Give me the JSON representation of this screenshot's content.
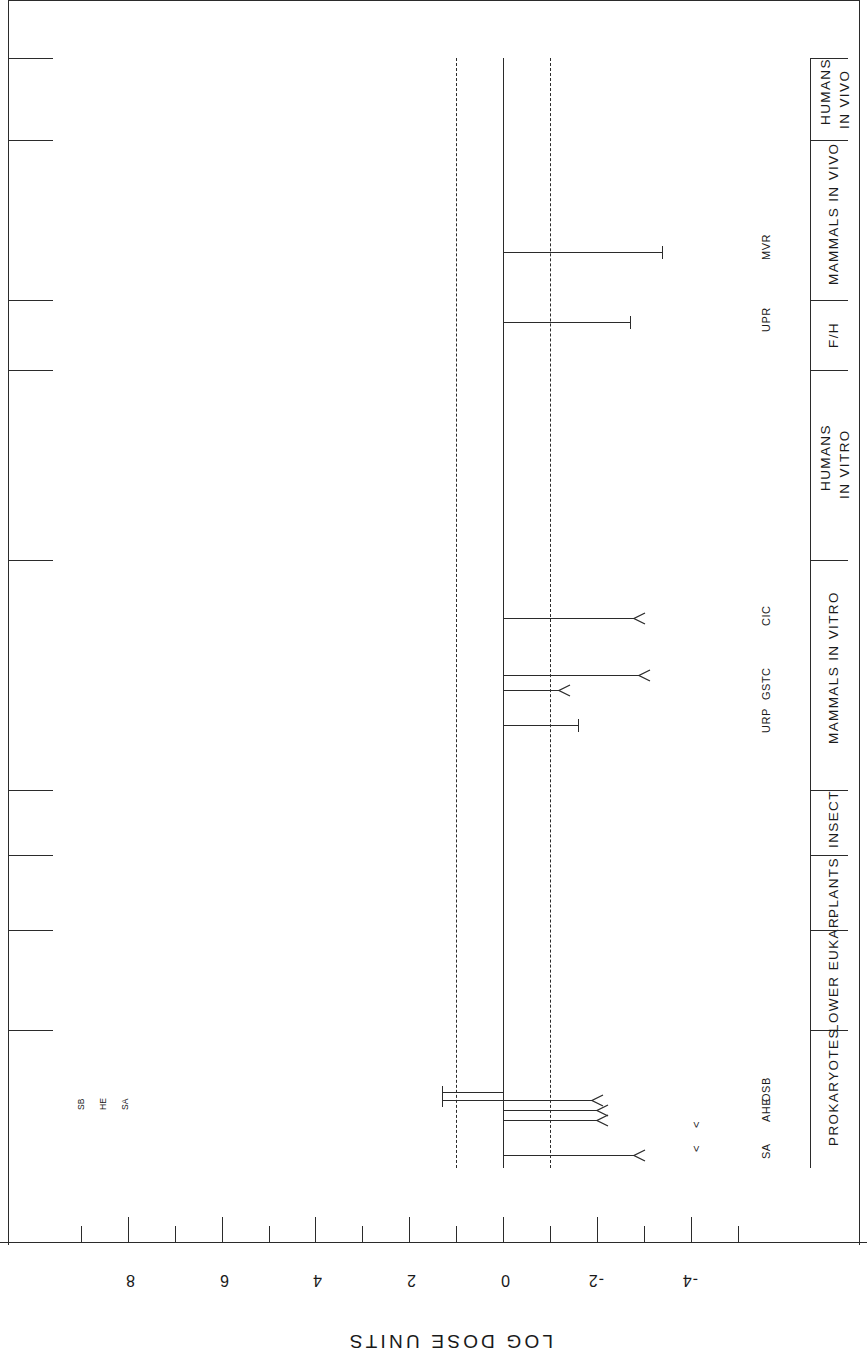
{
  "figure": {
    "axis_title": "LOG DOSE UNITS",
    "orientation": "rotated-90-ccw"
  },
  "chart_data": {
    "type": "bar",
    "title": "LOG DOSE UNITS",
    "xlabel": "LOG DOSE UNITS",
    "ylabel": "",
    "orientation": "horizontal-ranges-rotated",
    "axis_ticks_major": [
      8,
      6,
      4,
      2,
      0,
      -2,
      -4
    ],
    "axis_ticks_minor": [
      9,
      7,
      5,
      3,
      1,
      -1,
      -3,
      -5
    ],
    "xlim": [
      9.3,
      -5.5
    ],
    "grid": false,
    "reference_lines": [
      {
        "value": 1,
        "style": "dashed",
        "label": ""
      },
      {
        "value": 0,
        "style": "solid",
        "label": ""
      },
      {
        "value": -1,
        "style": "dashed",
        "label": ""
      }
    ],
    "categories": [
      "PROKARYOTES",
      "LOWER EUKAR.",
      "PLANTS",
      "INSECT",
      "MAMMALS IN VITRO",
      "HUMANS IN VITRO",
      "F/H",
      "MAMMALS IN VIVO",
      "HUMANS IN VIVO"
    ],
    "series": [
      {
        "name": "ranges",
        "points": [
          {
            "category": "PROKARYOTES",
            "label": "SA",
            "start": 0.0,
            "end": -2.8,
            "end_marker": "arrow"
          },
          {
            "category": "PROKARYOTES",
            "label": "SAM",
            "start": 0.0,
            "end": -2.0,
            "end_marker": "arrow"
          },
          {
            "category": "PROKARYOTES",
            "label": "AHE",
            "start": 0.0,
            "end": -2.0,
            "end_marker": "arrow"
          },
          {
            "category": "PROKARYOTES",
            "label": "OSB",
            "start": 1.3,
            "end": -1.9,
            "end_marker": "arrow"
          },
          {
            "category": "PROKARYOTES",
            "label": "",
            "start": 1.3,
            "end": 0.0,
            "end_marker": "tcap"
          },
          {
            "category": "MAMMALS IN VITRO",
            "label": "URP",
            "start": 0.0,
            "end": -1.6,
            "end_marker": "tcap"
          },
          {
            "category": "MAMMALS IN VITRO",
            "label": "GSTC",
            "start": 0.0,
            "end": -1.2,
            "end_marker": "arrow"
          },
          {
            "category": "MAMMALS IN VITRO",
            "label": "GSIT",
            "start": 0.0,
            "end": -2.9,
            "end_marker": "arrow"
          },
          {
            "category": "MAMMALS IN VITRO",
            "label": "CIC",
            "start": 0.0,
            "end": -2.8,
            "end_marker": "arrow"
          },
          {
            "category": "MAMMALS IN VIVO",
            "label": "UPR",
            "start": 0.0,
            "end": -2.7,
            "end_marker": "tcap"
          },
          {
            "category": "MAMMALS IN VIVO",
            "label": "MVR",
            "start": 0.0,
            "end": -3.4,
            "end_marker": "tcap"
          }
        ]
      }
    ],
    "point_labels_prokaryotes": [
      "SA",
      "AHE",
      "OSB"
    ],
    "point_labels_mammals_in_vitro": [
      "URP",
      "GSTC",
      "CIC"
    ],
    "point_labels_mammals_in_vivo": [
      "UPR",
      "MVR"
    ],
    "high_end_annotations": [
      "SA",
      "HE",
      "SB"
    ],
    "lessthan_markers": [
      "<",
      "<"
    ]
  },
  "axis": {
    "ticks": [
      {
        "value": "8",
        "major": true
      },
      {
        "value": "",
        "major": false
      },
      {
        "value": "6",
        "major": true
      },
      {
        "value": "",
        "major": false
      },
      {
        "value": "4",
        "major": true
      },
      {
        "value": "",
        "major": false
      },
      {
        "value": "2",
        "major": true
      },
      {
        "value": "",
        "major": false
      },
      {
        "value": "0",
        "major": true
      },
      {
        "value": "",
        "major": false
      },
      {
        "value": "-2",
        "major": true
      },
      {
        "value": "",
        "major": false
      },
      {
        "value": "-4",
        "major": true
      },
      {
        "value": "",
        "major": false
      }
    ]
  }
}
